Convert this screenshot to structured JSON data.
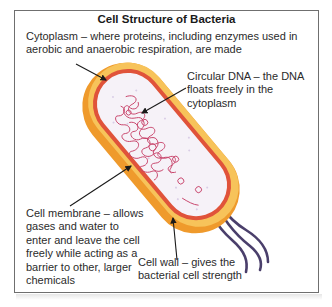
{
  "diagram": {
    "title": "Cell Structure of Bacteria",
    "labels": {
      "cytoplasm": "Cytoplasm – where proteins, including enzymes used in aerobic and anaerobic respiration, are made",
      "circular_dna": "Circular DNA – the DNA floats freely in the cytoplasm",
      "cell_membrane": "Cell membrane – allows gases and water to enter and leave the cell freely while acting as a barrier to other, larger chemicals",
      "cell_wall": "Cell wall – gives the bacterial cell strength"
    },
    "parts": [
      "cell-wall",
      "cell-membrane",
      "cytoplasm",
      "circular-dna",
      "flagella"
    ],
    "colors": {
      "cell_wall": "#f2a43a",
      "cell_wall_highlight": "#f7c35a",
      "cell_membrane": "#e0533a",
      "cytoplasm": "#f6f2f8",
      "dna": "#c8446a",
      "flagella": "#4a3f6b",
      "arrow": "#1a1a1a",
      "frame": "#6f6f6f"
    }
  }
}
